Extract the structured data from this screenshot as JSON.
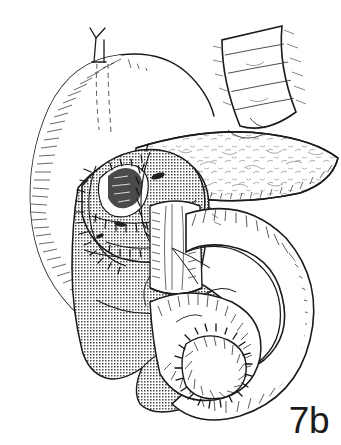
{
  "figure": {
    "label": "7b",
    "style": "black-and-white pen-and-ink line drawing with stipple and hatch shading",
    "background_color": "#ffffff",
    "ink_color": "#1b1b1b",
    "stipple_fill": "#b8b8b8",
    "width": 341,
    "height": 445
  },
  "structures": [
    {
      "id": "stomach",
      "name": "stomach",
      "description": "large curved viscus occupying the upper left, drawn in outline with fine radial hatching along the greater curvature",
      "shading": "hatched",
      "region": "upper-left"
    },
    {
      "id": "vessel-stub",
      "name": "ligated vessel stub",
      "description": "small Y-shaped divided vessel projecting from the superior border of the stomach",
      "shading": "outline",
      "region": "top-center-left"
    },
    {
      "id": "dashed-lines",
      "name": "hidden-margin dashed lines",
      "description": "two short vertical dashed lines indicating the resection margin concealed behind the stomach wall",
      "shading": "dashed-outline",
      "region": "upper-center"
    },
    {
      "id": "jejunal-limb-upper",
      "name": "efferent jejunal limb",
      "description": "banded tubular segment entering from the upper right, crossing behind the stomach",
      "shading": "banded-outline",
      "region": "upper-right"
    },
    {
      "id": "pancreas",
      "name": "pancreas body and tail",
      "description": "elongated lobulated gland sweeping from center to the right edge, stippled lightly with branching surface texture",
      "shading": "light-texture",
      "region": "center-right"
    },
    {
      "id": "anastomosis-upper",
      "name": "pancreaticojejunal anastomosis",
      "description": "stippled stump capped with multiple curved interrupted suture lines at the pancreatic head",
      "shading": "stippled",
      "region": "center-left"
    },
    {
      "id": "suture-line-upper",
      "name": "interrupted suture line",
      "description": "rows of short tick marks crossing the curved seam of the upper anastomosis",
      "shading": "line",
      "region": "center-left"
    },
    {
      "id": "duodenal-stump",
      "name": "duodenal stump / portal structures",
      "description": "vertical striated tubular structure descending behind the bowel loop at center",
      "shading": "striated",
      "region": "center"
    },
    {
      "id": "bowel-loop",
      "name": "jejunal loop",
      "description": "large S-shaped bowel loop sweeping down and around to the right, hatched on its illuminated surface",
      "shading": "hatched",
      "region": "center-right-lower"
    },
    {
      "id": "stippled-segment",
      "name": "stippled bowel segment",
      "description": "shaded in-shadow bowel and stomach remnant filling the lower left, rendered in dot-screen stipple",
      "shading": "stippled",
      "region": "lower-left"
    },
    {
      "id": "anastomosis-lower",
      "name": "jejunojejunal anastomosis",
      "description": "circular suture line joining the hatched loop to the stippled segment at lower center",
      "shading": "stippled",
      "region": "lower-center"
    },
    {
      "id": "suture-line-lower",
      "name": "interrupted suture line",
      "description": "ring of short tick marks around the lower anastomosis",
      "shading": "line",
      "region": "lower-center"
    }
  ]
}
